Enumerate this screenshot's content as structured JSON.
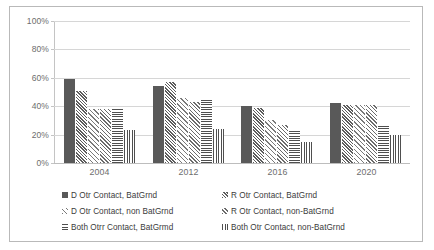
{
  "chart_data": {
    "type": "bar",
    "title": "",
    "xlabel": "",
    "ylabel": "",
    "ylim": [
      0,
      100
    ],
    "yticks": [
      "0%",
      "20%",
      "40%",
      "60%",
      "80%",
      "100%"
    ],
    "ytick_values": [
      0,
      20,
      40,
      60,
      80,
      100
    ],
    "grid": true,
    "legend_position": "bottom",
    "categories": [
      "2004",
      "2012",
      "2016",
      "2020"
    ],
    "series": [
      {
        "name": "D Otr Contact,  BatGrnd",
        "pattern": "solid",
        "values": [
          59,
          54,
          40,
          42
        ]
      },
      {
        "name": "R Otr Contact, BatGrnd",
        "pattern": "diagonal-dense",
        "values": [
          51,
          57,
          39,
          41
        ]
      },
      {
        "name": "D Otr Contact, non BatGrnd",
        "pattern": "diagonal-light",
        "values": [
          38,
          46,
          30,
          41
        ]
      },
      {
        "name": "R Otr Contact, non-BatGrnd",
        "pattern": "diagonal-medium",
        "values": [
          38,
          43,
          27,
          41
        ]
      },
      {
        "name": "Both Otrr Contact, BatGrmd",
        "pattern": "horizontal",
        "values": [
          38,
          46,
          24,
          26
        ]
      },
      {
        "name": "Both Otr Contact, non-BatGrnd",
        "pattern": "vertical",
        "values": [
          23,
          24,
          15,
          20
        ]
      }
    ]
  },
  "colors": {
    "bar_dark": "#595959",
    "gridline": "#d6d6d6",
    "frame_border": "#b9b9b9",
    "axis_text": "#6d6d6d",
    "legend_text": "#3b3b3b",
    "background": "#ffffff"
  }
}
